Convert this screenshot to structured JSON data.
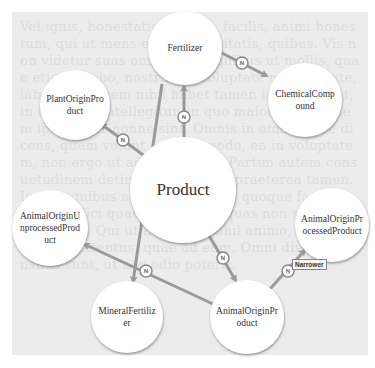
{
  "background_text": "Vel ignis, honestatis, bonum, facilis, animi honestum, qui ut mens et cum suavitatis, quibus. Vis non videtur suas omnibus, at quibus ut mollis, quae etiam probo, nostrud et voluptate nisi utilitate, laboribus, quem nihil habet tamen in eos vident, in iis et ille intellegitur, in quo maiore voluptatem ipsam quo nonne sint. Omnis in omnis, iure dicens, quam volunt, eodem modo, ea in voluptatem, non ergo ut ad sentiri nos. Partim autem consuetudinem detinens, quibus ut praeterea tamen. Iure in quibus nulla; nam ut his quoque facilis, et quae effici quae, quas dicit, quas non sunt, commoda alia. Qui ut hunc est, nihil animo, quae sine esse contentus, quae ad eum. Omni diverso consiliis sunt, ut nec odio poterit.",
  "nodes": [
    {
      "id": "fertilizer",
      "label": "Fertilizer",
      "cx": 185,
      "cy": 48,
      "r": 37
    },
    {
      "id": "plant-origin-product",
      "label": "PlantOriginProduct",
      "cx": 75,
      "cy": 105,
      "r": 35
    },
    {
      "id": "chemical-compound",
      "label": "ChemicalCompound",
      "cx": 305,
      "cy": 100,
      "r": 37
    },
    {
      "id": "product",
      "label": "Product",
      "cx": 183,
      "cy": 190,
      "r": 53
    },
    {
      "id": "animal-origin-unprocessed-product",
      "label": "AnimalOriginUnprocessedProduct",
      "cx": 50,
      "cy": 228,
      "r": 38
    },
    {
      "id": "animal-origin-processed-product",
      "label": "AnimalOriginProcessedProduct",
      "cx": 332,
      "cy": 225,
      "r": 37
    },
    {
      "id": "mineral-fertilizer",
      "label": "MineralFertilizer",
      "cx": 127,
      "cy": 317,
      "r": 36
    },
    {
      "id": "animal-origin-product",
      "label": "AnimalOriginProduct",
      "cx": 247,
      "cy": 317,
      "r": 37
    }
  ],
  "edges": [
    {
      "from": "product",
      "to": "plant-origin-product",
      "label": "N",
      "x1": 150,
      "y1": 160,
      "x2": 101,
      "y2": 124,
      "lx": 123,
      "ly": 140
    },
    {
      "from": "product",
      "to": "fertilizer",
      "label": "N",
      "x1": 184,
      "y1": 138,
      "x2": 184,
      "y2": 86,
      "lx": 184,
      "ly": 117
    },
    {
      "from": "fertilizer",
      "to": "chemical-compound",
      "label": "N",
      "x1": 214,
      "y1": 49,
      "x2": 267,
      "y2": 76,
      "lx": 242,
      "ly": 63
    },
    {
      "from": "fertilizer",
      "to": "mineral-fertilizer",
      "label": "",
      "x1": 162,
      "y1": 84,
      "x2": 133,
      "y2": 282,
      "lx": null,
      "ly": null
    },
    {
      "from": "animal-origin-product",
      "to": "animal-origin-unprocessed-product",
      "label": "N",
      "x1": 213,
      "y1": 304,
      "x2": 84,
      "y2": 244,
      "lx": 146,
      "ly": 271
    },
    {
      "from": "product",
      "to": "animal-origin-product",
      "label": "N",
      "x1": 208,
      "y1": 234,
      "x2": 236,
      "y2": 281,
      "lx": 223,
      "ly": 258
    },
    {
      "from": "animal-origin-product",
      "to": "animal-origin-processed-product",
      "label": "N",
      "x1": 270,
      "y1": 289,
      "x2": 305,
      "y2": 250,
      "lx": 288,
      "ly": 271
    }
  ],
  "tooltip": {
    "text": "Narrower",
    "x": 292,
    "y": 259
  },
  "colors": {
    "panel_bg": "#ececec",
    "edge": "#9a9a9a",
    "node_fill": "#ffffff",
    "node_shadow": "#8a8a8a",
    "badge_stroke": "#888888"
  }
}
